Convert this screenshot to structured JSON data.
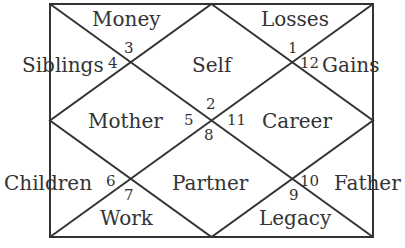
{
  "chart_type": "North Indian Birth Chart",
  "colors": {
    "line": "#333333",
    "text": "#333333",
    "background": "#ffffff"
  },
  "houses": [
    {
      "number": "1",
      "label": "Self"
    },
    {
      "number": "2",
      "label": "Money"
    },
    {
      "number": "3",
      "label": "Siblings"
    },
    {
      "number": "4",
      "label": "Mother"
    },
    {
      "number": "5",
      "label": "Children"
    },
    {
      "number": "6",
      "label": "Work"
    },
    {
      "number": "7",
      "label": "Partner"
    },
    {
      "number": "8",
      "label": "Legacy"
    },
    {
      "number": "9",
      "label": "Father"
    },
    {
      "number": "10",
      "label": "Career"
    },
    {
      "number": "11",
      "label": "Gains"
    },
    {
      "number": "12",
      "label": "Losses"
    }
  ],
  "labels": {
    "money": "Money",
    "losses": "Losses",
    "siblings": "Siblings",
    "self": "Self",
    "gains": "Gains",
    "mother": "Mother",
    "career": "Career",
    "children": "Children",
    "partner": "Partner",
    "father": "Father",
    "work": "Work",
    "legacy": "Legacy"
  },
  "numbers": {
    "n1": "1",
    "n2": "2",
    "n3": "3",
    "n4": "4",
    "n5": "5",
    "n6": "6",
    "n7": "7",
    "n8": "8",
    "n9": "9",
    "n10": "10",
    "n11": "11",
    "n12": "12"
  }
}
